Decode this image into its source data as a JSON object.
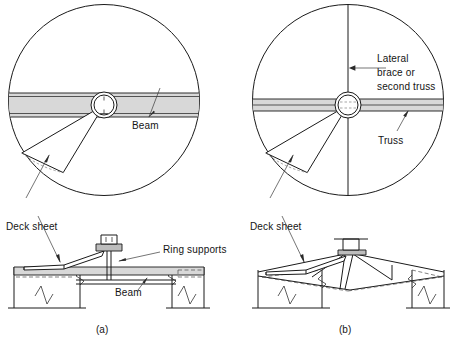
{
  "figure": {
    "panels": [
      {
        "id": "a",
        "caption": "(a)",
        "support_type": "beam",
        "plan_labels": [
          {
            "name": "beam",
            "text": "Beam"
          },
          {
            "name": "deck-sheet",
            "text": "Deck sheet"
          }
        ],
        "section_labels": [
          {
            "name": "ring-supports",
            "text": "Ring supports"
          },
          {
            "name": "beam",
            "text": "Beam"
          }
        ]
      },
      {
        "id": "b",
        "caption": "(b)",
        "support_type": "truss",
        "plan_labels": [
          {
            "name": "lateral-brace",
            "text": "Lateral\nbrace or\nsecond truss"
          },
          {
            "name": "lateral-brace-line-1",
            "text": "Lateral"
          },
          {
            "name": "lateral-brace-line-2",
            "text": "brace or"
          },
          {
            "name": "lateral-brace-line-3",
            "text": "second truss"
          },
          {
            "name": "truss",
            "text": "Truss"
          },
          {
            "name": "deck-sheet",
            "text": "Deck sheet"
          }
        ],
        "section_labels": []
      }
    ]
  },
  "labels": {
    "beam_plan_a": "Beam",
    "deck_sheet_a": "Deck sheet",
    "ring_supports_a": "Ring supports",
    "beam_section_a": "Beam",
    "caption_a": "(a)",
    "lateral_brace_l1": "Lateral",
    "lateral_brace_l2": "brace or",
    "lateral_brace_l3": "second truss",
    "truss_plan_b": "Truss",
    "deck_sheet_b": "Deck sheet",
    "caption_b": "(b)"
  },
  "geometry": {
    "panel_a": {
      "circle": {
        "cx": 104,
        "cy": 100,
        "r": 96
      },
      "hub": {
        "cx": 104,
        "cy": 105,
        "r_outer": 13,
        "r_inner": 10
      },
      "beam_band": {
        "y_top": 93,
        "y_bottom": 117,
        "orientation": "horizontal"
      },
      "deck_wedge_angles_deg": [
        150,
        188
      ]
    },
    "panel_b": {
      "circle": {
        "cx": 348,
        "cy": 100,
        "r": 96
      },
      "hub": {
        "cx": 348,
        "cy": 105,
        "r_outer": 13,
        "r_inner": 10
      },
      "truss_band": {
        "y_top": 99,
        "y_bottom": 111,
        "orientation": "horizontal"
      },
      "lateral_brace": {
        "orientation": "vertical"
      },
      "deck_wedge_angles_deg": [
        150,
        188
      ]
    }
  },
  "colors": {
    "line": "#1a1a1a",
    "band_fill": "#d8d8d8",
    "hidden_line": "#4a4a4a",
    "background": "#ffffff",
    "text": "#141414"
  }
}
